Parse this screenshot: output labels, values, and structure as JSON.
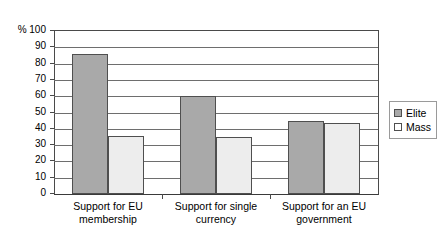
{
  "chart_data": {
    "type": "bar",
    "title": "",
    "xlabel": "",
    "ylabel": "%",
    "ylim": [
      0,
      100
    ],
    "ytick_step": 10,
    "grid": true,
    "legend_position": "right",
    "categories": [
      "Support for EU\nmembership",
      "Support for single\ncurrency",
      "Support for an EU\ngovernment"
    ],
    "series": [
      {
        "name": "Elite",
        "color": "#a9a9a9",
        "values": [
          86,
          60,
          44.5
        ]
      },
      {
        "name": "Mass",
        "color": "#ededed",
        "values": [
          35.5,
          35,
          43.5
        ]
      }
    ],
    "ytick_labels": [
      "100",
      "90",
      "80",
      "70",
      "60",
      "50",
      "40",
      "30",
      "20",
      "10",
      "0"
    ],
    "ytick_values": [
      100,
      90,
      80,
      70,
      60,
      50,
      40,
      30,
      20,
      10,
      0
    ],
    "axis_unit_label": "%"
  }
}
